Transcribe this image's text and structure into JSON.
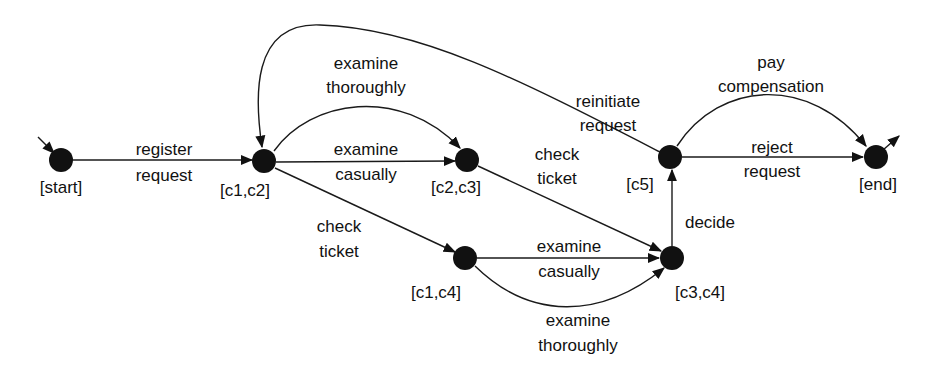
{
  "diagram": {
    "type": "transition-system",
    "nodes": [
      {
        "id": "start",
        "label": "[start]",
        "x": 61,
        "y": 160,
        "lx": 61,
        "ly": 193
      },
      {
        "id": "c1c2",
        "label": "[c1,c2]",
        "x": 264,
        "y": 161,
        "lx": 245,
        "ly": 196
      },
      {
        "id": "c2c3",
        "label": "[c2,c3]",
        "x": 467,
        "y": 160,
        "lx": 456,
        "ly": 193
      },
      {
        "id": "c1c4",
        "label": "[c1,c4]",
        "x": 465,
        "y": 258,
        "lx": 436,
        "ly": 298
      },
      {
        "id": "c3c4",
        "label": "[c3,c4]",
        "x": 672,
        "y": 258,
        "lx": 700,
        "ly": 298
      },
      {
        "id": "c5",
        "label": "[c5]",
        "x": 670,
        "y": 157,
        "lx": 640,
        "ly": 190
      },
      {
        "id": "end",
        "label": "[end]",
        "x": 876,
        "y": 157,
        "lx": 878,
        "ly": 190
      }
    ],
    "edges": [
      {
        "from": "start",
        "to": "c1c2",
        "label1": "register",
        "label2": "request",
        "lx": 164,
        "ly1": 155,
        "ly2": 181
      },
      {
        "from": "c1c2",
        "to": "c2c3",
        "label1": "examine",
        "label2": "casually",
        "lx": 366,
        "ly1": 155,
        "ly2": 180
      },
      {
        "from": "c1c2",
        "to": "c2c3",
        "curved": true,
        "label1": "examine",
        "label2": "thoroughly",
        "lx": 366,
        "ly1": 69,
        "ly2": 93
      },
      {
        "from": "c1c2",
        "to": "c1c4",
        "label1": "check",
        "label2": "ticket",
        "lx": 339,
        "ly1": 232,
        "ly2": 257
      },
      {
        "from": "c2c3",
        "to": "c3c4",
        "label1": "check",
        "label2": "ticket",
        "lx": 557,
        "ly1": 160,
        "ly2": 184
      },
      {
        "from": "c1c4",
        "to": "c3c4",
        "label1": "examine",
        "label2": "casually",
        "lx": 569,
        "ly1": 252,
        "ly2": 277
      },
      {
        "from": "c1c4",
        "to": "c3c4",
        "curved": true,
        "label1": "examine",
        "label2": "thoroughly",
        "lx": 578,
        "ly1": 326,
        "ly2": 351
      },
      {
        "from": "c3c4",
        "to": "c5",
        "label1": "decide",
        "label2": "",
        "lx": 710,
        "ly1": 228,
        "ly2": 0
      },
      {
        "from": "c5",
        "to": "c1c2",
        "curved": true,
        "label1": "reinitiate",
        "label2": "request",
        "lx": 608,
        "ly1": 107,
        "ly2": 131
      },
      {
        "from": "c5",
        "to": "end",
        "label1": "reject",
        "label2": "request",
        "lx": 772,
        "ly1": 153,
        "ly2": 177
      },
      {
        "from": "c5",
        "to": "end",
        "curved": true,
        "label1": "pay",
        "label2": "compensation",
        "lx": 771,
        "ly1": 68,
        "ly2": 92
      }
    ]
  }
}
